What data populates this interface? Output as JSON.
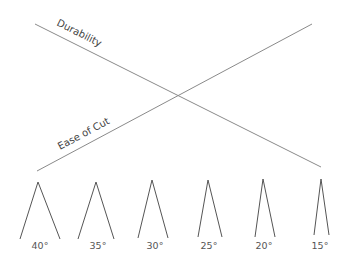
{
  "diagram": {
    "title": "",
    "lines": [
      {
        "name": "durability",
        "label": "Durability",
        "x1": 35,
        "y1": 24,
        "x2": 321,
        "y2": 167,
        "label_x": 56,
        "label_y": 25,
        "label_angle": 26.6
      },
      {
        "name": "ease-of-cut",
        "label": "Ease of Cut",
        "x1": 37,
        "y1": 171,
        "x2": 312,
        "y2": 24,
        "label_x": 60,
        "label_y": 150,
        "label_angle": -28.1
      }
    ],
    "blades": [
      {
        "angle_label": "40°",
        "apex_x": 38,
        "apex_y": 182,
        "left_x": 20,
        "right_x": 60,
        "base_y": 239,
        "label_x": 40,
        "label_y": 249
      },
      {
        "angle_label": "35°",
        "apex_x": 96,
        "apex_y": 182,
        "left_x": 78,
        "right_x": 114,
        "base_y": 239,
        "label_x": 98,
        "label_y": 249
      },
      {
        "angle_label": "30°",
        "apex_x": 152,
        "apex_y": 180,
        "left_x": 138,
        "right_x": 168,
        "base_y": 238,
        "label_x": 155,
        "label_y": 249
      },
      {
        "angle_label": "25°",
        "apex_x": 208,
        "apex_y": 180,
        "left_x": 198,
        "right_x": 222,
        "base_y": 237,
        "label_x": 209,
        "label_y": 249
      },
      {
        "angle_label": "20°",
        "apex_x": 263,
        "apex_y": 179,
        "left_x": 255,
        "right_x": 275,
        "base_y": 237,
        "label_x": 264,
        "label_y": 249
      },
      {
        "angle_label": "15°",
        "apex_x": 321,
        "apex_y": 179,
        "left_x": 314,
        "right_x": 329,
        "base_y": 235,
        "label_x": 320,
        "label_y": 249
      }
    ]
  }
}
